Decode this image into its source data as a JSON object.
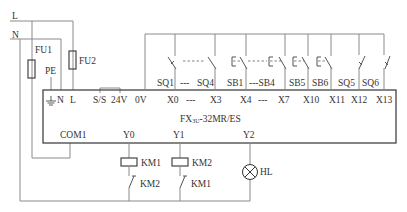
{
  "diagram": {
    "plc": {
      "model_prefix": "FX",
      "model_sub": "3U",
      "model_suffix": "-32MR/ES",
      "power_terminals": [
        "⏚",
        "N",
        "L"
      ],
      "supply_terminals": [
        "S/S",
        "24V",
        "0V"
      ],
      "input_terminals": [
        "X0",
        "---",
        "X3",
        "X4",
        "---",
        "X7",
        "X10",
        "X11",
        "X12",
        "X13"
      ],
      "output_terminals": [
        "COM1",
        "Y0",
        "Y1",
        "Y2"
      ]
    },
    "supply": {
      "line": "L",
      "neutral": "N",
      "protective_earth": "PE",
      "fuse1": "FU1",
      "fuse2": "FU2"
    },
    "inputs": {
      "labels": [
        "SQ1",
        "---",
        "SQ4",
        "SB1",
        "---SB4",
        "SB5",
        "SB6",
        "SQ5",
        "SQ6"
      ]
    },
    "outputs": {
      "coil1": "KM1",
      "interlock1": "KM2",
      "coil2": "KM2",
      "interlock2": "KM1",
      "lamp": "HL"
    }
  }
}
